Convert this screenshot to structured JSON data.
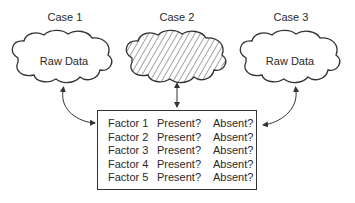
{
  "cases": [
    {
      "title": "Case 1",
      "label": "Raw Data",
      "hatched": false
    },
    {
      "title": "Case 2",
      "label": "",
      "hatched": true
    },
    {
      "title": "Case 3",
      "label": "Raw Data",
      "hatched": false
    }
  ],
  "factors": [
    {
      "name": "Factor 1",
      "present": "Present?",
      "absent": "Absent?"
    },
    {
      "name": "Factor 2",
      "present": "Present?",
      "absent": "Absent?"
    },
    {
      "name": "Factor 3",
      "present": "Present?",
      "absent": "Absent?"
    },
    {
      "name": "Factor 4",
      "present": "Present?",
      "absent": "Absent?"
    },
    {
      "name": "Factor 5",
      "present": "Present?",
      "absent": "Absent?"
    }
  ],
  "colors": {
    "stroke": "#333333",
    "text": "#2a2a2a",
    "background": "#ffffff"
  }
}
